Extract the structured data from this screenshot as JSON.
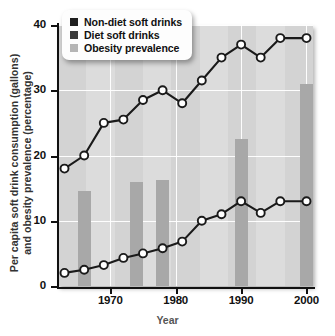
{
  "chart_data": {
    "type": "line",
    "title": "",
    "xlabel": "Year",
    "ylabel": "Per capita soft drink consumption (gallons) and obesity prevalence (percentage)",
    "ylabel_line1": "Per capita soft drink consumption (gallons)",
    "ylabel_line2": "and obesity prevalence (percentage)",
    "xlim": [
      1962,
      2001
    ],
    "ylim": [
      0,
      40
    ],
    "yticks": [
      0,
      10,
      20,
      30,
      40
    ],
    "xticks": [
      1970,
      1980,
      1990,
      2000
    ],
    "grid": true,
    "legend_position": "top-left",
    "series": [
      {
        "name": "Non-diet soft drinks",
        "type": "line",
        "color": "#1a1a1a",
        "marker": "circle-open",
        "x": [
          1963,
          1966,
          1969,
          1972,
          1975,
          1978,
          1981,
          1984,
          1987,
          1990,
          1993,
          1996,
          2000
        ],
        "values": [
          18.0,
          20.0,
          25.0,
          25.5,
          28.5,
          30.0,
          28.0,
          31.5,
          35.0,
          37.0,
          35.0,
          38.0,
          38.0
        ]
      },
      {
        "name": "Diet soft drinks",
        "type": "line",
        "color": "#1a1a1a",
        "marker": "circle-open",
        "x": [
          1963,
          1966,
          1969,
          1972,
          1975,
          1978,
          1981,
          1984,
          1987,
          1990,
          1993,
          1996,
          2000
        ],
        "values": [
          2.0,
          2.5,
          3.2,
          4.3,
          5.0,
          5.8,
          6.8,
          10.0,
          11.0,
          13.0,
          11.2,
          13.0,
          13.0
        ]
      },
      {
        "name": "Obesity prevalence",
        "type": "bar",
        "color": "#a8a8a8",
        "x": [
          1966,
          1974,
          1978,
          1990,
          2000
        ],
        "values": [
          14.5,
          16.0,
          16.3,
          22.5,
          31.0
        ]
      }
    ]
  },
  "legend": {
    "items": [
      {
        "label": "Non-diet soft drinks",
        "color": "#1f1f1f"
      },
      {
        "label": "Diet soft drinks",
        "color": "#3a3a3a"
      },
      {
        "label": "Obesity prevalence",
        "color": "#b5b5b5"
      }
    ]
  },
  "axes": {
    "y_labels": [
      "40",
      "30",
      "20",
      "10",
      "0"
    ],
    "x_labels": [
      "1970",
      "1980",
      "1990",
      "2000"
    ],
    "x_title": "Year",
    "y_title_line1": "Per capita soft drink consumption (gallons)",
    "y_title_line2": "and obesity prevalence (percentage)"
  }
}
